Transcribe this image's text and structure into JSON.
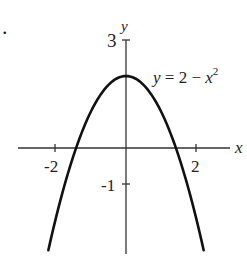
{
  "chart_data": {
    "type": "line",
    "title": "",
    "equation_label": "y = 2 − x²",
    "xlabel": "x",
    "ylabel": "y",
    "xlim": [
      -3.1,
      3.0
    ],
    "ylim": [
      -3.1,
      3.0
    ],
    "x_ticks": [
      {
        "value": -2,
        "label": "-2"
      },
      {
        "value": 2,
        "label": "2"
      }
    ],
    "y_ticks": [
      {
        "value": 3,
        "label": "3"
      },
      {
        "value": -1,
        "label": "-1"
      }
    ],
    "grid": false,
    "series": [
      {
        "name": "y = 2 - x^2",
        "function": "2 - x^2",
        "x": [
          -2.2,
          -2.0,
          -1.5,
          -1.0,
          -0.5,
          0.0,
          0.5,
          1.0,
          1.5,
          2.0,
          2.2
        ],
        "y": [
          -2.84,
          -2.0,
          -0.25,
          1.0,
          1.75,
          2.0,
          1.75,
          1.0,
          -0.25,
          -2.0,
          -2.84
        ]
      }
    ],
    "vertex": {
      "x": 0,
      "y": 2
    },
    "x_intercepts": [
      -1.414,
      1.414
    ]
  },
  "labels": {
    "bullet": ".",
    "y_axis": "y",
    "x_axis": "x",
    "tick_y3": "3",
    "tick_ym1": "-1",
    "tick_xm2": "-2",
    "tick_x2": "2",
    "eq_y": "y",
    "eq_mid": " = 2 − ",
    "eq_x": "x",
    "eq_exp": "2"
  },
  "colors": {
    "curve": "#111111",
    "axis": "#333333",
    "text": "#222222"
  }
}
